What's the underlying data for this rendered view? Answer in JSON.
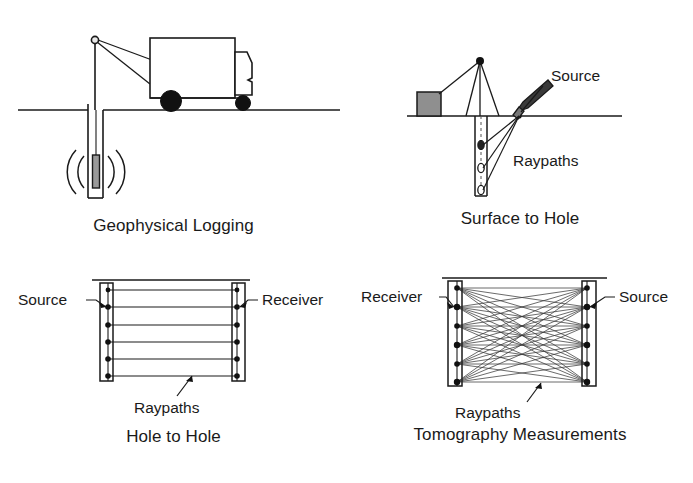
{
  "figure": {
    "background_color": "#ffffff",
    "line_color": "#1a1a1a",
    "fill_gray": "#8a8a8a"
  },
  "panels": [
    {
      "id": "geophysical-logging",
      "caption": "Geophysical Logging",
      "elements": {
        "vehicle": "logging-truck",
        "mast": "mast-with-pulley",
        "borehole": "cased-borehole",
        "probe": "logging-probe",
        "waves": "radiating-wave-arcs",
        "ground": "ground-surface-line"
      },
      "labels": []
    },
    {
      "id": "surface-to-hole",
      "caption": "Surface to Hole",
      "elements": {
        "derrick": "tripod-derrick",
        "box": "equipment-box",
        "hammer": "sledgehammer-source",
        "borehole": "cased-borehole",
        "receivers": "three-downhole-receivers",
        "ground": "ground-surface-line"
      },
      "labels": [
        {
          "text": "Source",
          "target": "hammer-impact-point"
        },
        {
          "text": "Raypaths",
          "target": "ray-fan"
        }
      ]
    },
    {
      "id": "hole-to-hole",
      "caption": "Hole to Hole",
      "elements": {
        "left_borehole": "source-borehole",
        "right_borehole": "receiver-borehole",
        "raypaths": "six-horizontal-raypaths",
        "ground": "ground-surface-line"
      },
      "labels": [
        {
          "text": "Source",
          "target": "left-borehole-source-point"
        },
        {
          "text": "Receiver",
          "target": "right-borehole-receiver-point"
        },
        {
          "text": "Raypaths",
          "target": "horizontal-ray-bundle"
        }
      ],
      "counts": {
        "sources": 6,
        "receivers": 6,
        "raypaths": 6
      }
    },
    {
      "id": "tomography-measurements",
      "caption": "Tomography Measurements",
      "elements": {
        "left_borehole": "receiver-borehole",
        "right_borehole": "source-borehole",
        "raypaths": "full-crossing-ray-fan",
        "ground": "ground-surface-line"
      },
      "labels": [
        {
          "text": "Receiver",
          "target": "left-borehole-receiver-point"
        },
        {
          "text": "Source",
          "target": "right-borehole-source-point"
        },
        {
          "text": "Raypaths",
          "target": "crossing-ray-bundle"
        }
      ],
      "counts": {
        "sources": 6,
        "receivers": 6,
        "raypaths": 36
      }
    }
  ]
}
